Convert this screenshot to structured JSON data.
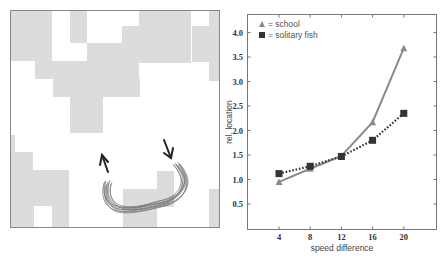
{
  "figure": {
    "left_panel": {
      "description": "grid arena with fish trajectories",
      "border_color": "#888888",
      "cell_color": "#dcdcdc",
      "trajectory_color": "#6a6a6a",
      "arrow_color": "#222222"
    },
    "right_panel": {
      "legend": [
        {
          "marker": "triangle",
          "label": "= school"
        },
        {
          "marker": "square",
          "label": "= solitary fish"
        }
      ]
    }
  },
  "chart_data": {
    "type": "line",
    "title": "",
    "xlabel": "speed difference",
    "ylabel": "rel. location",
    "x": [
      4,
      8,
      12,
      16,
      20
    ],
    "x_tick_labels": [
      "4",
      "8",
      "12",
      "16",
      "20"
    ],
    "y_tick_labels": [
      "0.5",
      "1.0",
      "1.5",
      "2.0",
      "2.5",
      "3.0",
      "3.5",
      "4.0"
    ],
    "ylim": [
      0,
      4.3
    ],
    "xlim": [
      0,
      24
    ],
    "grid": false,
    "legend_position": "upper left",
    "series": [
      {
        "name": "school",
        "marker": "triangle",
        "line": "solid",
        "color": "#8a8a8a",
        "values": [
          0.95,
          1.22,
          1.48,
          2.17,
          3.68
        ]
      },
      {
        "name": "solitary fish",
        "marker": "square",
        "line": "dotted",
        "color": "#333333",
        "values": [
          1.12,
          1.27,
          1.47,
          1.8,
          2.35
        ]
      }
    ]
  }
}
